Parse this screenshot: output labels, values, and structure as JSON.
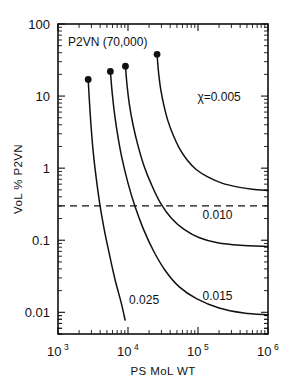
{
  "chart_data": {
    "type": "line",
    "title": "",
    "annotation": "P2VN (70,000)",
    "xlabel": "PS MoL WT",
    "ylabel": "VoL % P2VN",
    "xscale": "log",
    "yscale": "log",
    "xlim": [
      1000,
      1000000
    ],
    "ylim": [
      0.005,
      100
    ],
    "xticklabels": [
      "10",
      "10",
      "10",
      "10"
    ],
    "xtickexponents": [
      "3",
      "4",
      "5",
      "6"
    ],
    "xtickvalues": [
      1000,
      10000,
      100000,
      1000000
    ],
    "yticklabels": [
      "100",
      "10",
      "1",
      "0.1",
      "0.01"
    ],
    "ytickvalues": [
      100,
      10,
      1,
      0.1,
      0.01
    ],
    "grid": false,
    "legend_position": "inline-curve-labels",
    "reference_line": {
      "orientation": "horizontal",
      "value": 0.3,
      "style": "dashed"
    },
    "series": [
      {
        "name": "chi = 0.005",
        "label": "χ=0.005",
        "label_x": 200000,
        "label_y": 8.5,
        "endpoint_marker": true,
        "points": [
          [
            26000,
            38
          ],
          [
            27500,
            20
          ],
          [
            29500,
            12
          ],
          [
            32500,
            7.5
          ],
          [
            37000,
            4.6
          ],
          [
            44000,
            2.9
          ],
          [
            54000,
            1.9
          ],
          [
            70000,
            1.3
          ],
          [
            95000,
            0.95
          ],
          [
            140000,
            0.75
          ],
          [
            220000,
            0.62
          ],
          [
            360000,
            0.55
          ],
          [
            600000,
            0.51
          ],
          [
            1000000,
            0.49
          ]
        ]
      },
      {
        "name": "chi = 0.010",
        "label": "0.010",
        "label_x": 190000,
        "label_y": 0.2,
        "endpoint_marker": true,
        "points": [
          [
            9200,
            26
          ],
          [
            9700,
            14
          ],
          [
            10500,
            7.5
          ],
          [
            11800,
            4.0
          ],
          [
            13800,
            2.1
          ],
          [
            16800,
            1.1
          ],
          [
            21500,
            0.6
          ],
          [
            29000,
            0.33
          ],
          [
            42000,
            0.2
          ],
          [
            64000,
            0.14
          ],
          [
            105000,
            0.108
          ],
          [
            190000,
            0.092
          ],
          [
            400000,
            0.085
          ],
          [
            1000000,
            0.082
          ]
        ]
      },
      {
        "name": "chi = 0.015",
        "label": "0.015",
        "label_x": 190000,
        "label_y": 0.015,
        "endpoint_marker": true,
        "points": [
          [
            5600,
            22
          ],
          [
            5950,
            11
          ],
          [
            6450,
            5.5
          ],
          [
            7200,
            2.7
          ],
          [
            8300,
            1.3
          ],
          [
            10000,
            0.62
          ],
          [
            12500,
            0.3
          ],
          [
            16500,
            0.145
          ],
          [
            23000,
            0.072
          ],
          [
            34000,
            0.038
          ],
          [
            54000,
            0.0225
          ],
          [
            95000,
            0.0155
          ],
          [
            200000,
            0.0115
          ],
          [
            450000,
            0.0098
          ],
          [
            1000000,
            0.0092
          ]
        ]
      },
      {
        "name": "chi = 0.025",
        "label": "0.025",
        "label_x": 17000,
        "label_y": 0.013,
        "endpoint_marker": true,
        "points": [
          [
            2700,
            17
          ],
          [
            2820,
            8.0
          ],
          [
            2980,
            3.6
          ],
          [
            3200,
            1.6
          ],
          [
            3520,
            0.72
          ],
          [
            3950,
            0.32
          ],
          [
            4550,
            0.145
          ],
          [
            5400,
            0.065
          ],
          [
            6500,
            0.029
          ],
          [
            8000,
            0.0135
          ],
          [
            9100,
            0.0078
          ]
        ]
      }
    ]
  }
}
